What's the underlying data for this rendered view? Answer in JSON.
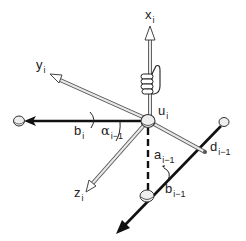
{
  "diagram": {
    "type": "kinematic-joint-frame",
    "colors": {
      "background": "#ffffff",
      "line": "#111111",
      "rod_fill": "#d8d8d8",
      "rod_stroke": "#555555",
      "ball_fill": "#eeeeee"
    },
    "labels": {
      "x_axis": {
        "main": "x",
        "sub": "i"
      },
      "y_axis": {
        "main": "y",
        "sub": "i"
      },
      "z_axis": {
        "main": "z",
        "sub": "i"
      },
      "joint_u": {
        "main": "u",
        "sub": "i"
      },
      "b_i": {
        "main": "b",
        "sub": "i"
      },
      "alpha": {
        "main": "α",
        "sub": "i−1"
      },
      "a": {
        "main": "a",
        "sub": "i−1"
      },
      "d": {
        "main": "d",
        "sub": "i−1"
      },
      "b_prev": {
        "main": "b",
        "sub": "i−1"
      }
    },
    "icons": [
      "right-hand-icon",
      "joint-ball-icon"
    ]
  }
}
